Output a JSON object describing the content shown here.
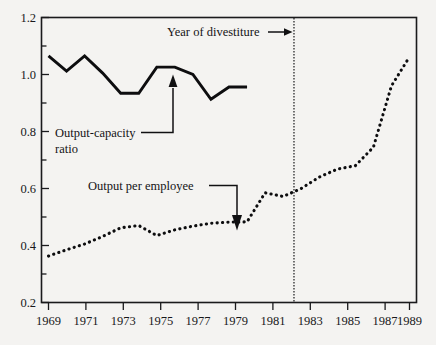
{
  "chart_data": {
    "type": "line",
    "title": "",
    "xlabel": "",
    "ylabel": "",
    "xlim": [
      1969,
      1989
    ],
    "ylim": [
      0.2,
      1.2
    ],
    "grid": false,
    "legend_position": "inline-annotations",
    "y_ticks": [
      "0.2",
      "0.4",
      "0.6",
      "0.8",
      "1.0",
      "1.2"
    ],
    "y_tick_values": [
      0.2,
      0.4,
      0.6,
      0.8,
      1.0,
      1.2
    ],
    "y_minor_tick_values": [
      0.3,
      0.5,
      0.7,
      0.9,
      1.1
    ],
    "x_ticks": [
      "1969",
      "1971",
      "1973",
      "1975",
      "1977",
      "1979",
      "1981",
      "1983",
      "1985",
      "1987",
      "1989"
    ],
    "x_tick_values": [
      1969,
      1971,
      1973,
      1975,
      1977,
      1979,
      1981,
      1983,
      1985,
      1987,
      1989
    ],
    "series": [
      {
        "name": "Output-capacity ratio",
        "style": "solid",
        "x": [
          1969,
          1970,
          1971,
          1972,
          1973,
          1974,
          1975,
          1976,
          1977,
          1978,
          1979,
          1980
        ],
        "values": [
          1.065,
          1.012,
          1.065,
          1.005,
          0.934,
          0.934,
          1.026,
          1.026,
          1.0,
          0.913,
          0.956,
          0.956
        ]
      },
      {
        "name": "Output per employee",
        "style": "dotted",
        "x": [
          1969,
          1970,
          1971,
          1972,
          1973,
          1974,
          1975,
          1976,
          1977,
          1978,
          1979,
          1980,
          1981,
          1982,
          1983,
          1984,
          1985,
          1986,
          1987,
          1988,
          1989
        ],
        "values": [
          0.363,
          0.385,
          0.405,
          0.432,
          0.462,
          0.47,
          0.435,
          0.455,
          0.468,
          0.478,
          0.482,
          0.483,
          0.585,
          0.572,
          0.6,
          0.64,
          0.668,
          0.68,
          0.745,
          0.96,
          1.062
        ]
      }
    ],
    "annotations": [
      {
        "id": "year-of-divestiture",
        "text": "Year of divestiture",
        "arrow": "right",
        "points_to_x": 1982.6
      },
      {
        "id": "output-capacity-ratio",
        "text_line1": "Output-capacity",
        "text_line2": "ratio",
        "arrow": "up",
        "points_to": {
          "x": 1975.6,
          "y": 1.01
        }
      },
      {
        "id": "output-per-employee",
        "text": "Output per employee",
        "arrow": "down",
        "points_to": {
          "x": 1979.6,
          "y": 0.5
        }
      }
    ],
    "reference_lines": [
      {
        "id": "divestiture",
        "orientation": "vertical",
        "x": 1982.6,
        "style": "dotted"
      }
    ]
  }
}
